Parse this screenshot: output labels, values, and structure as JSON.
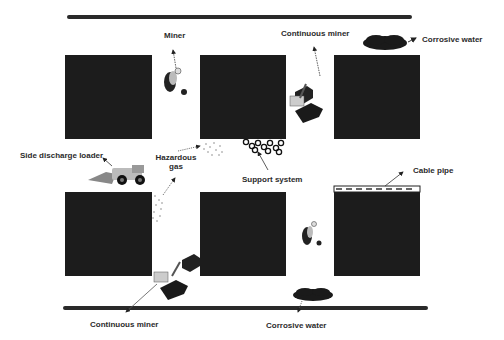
{
  "diagram": {
    "walls": [
      {
        "id": "top-wall",
        "x": 67,
        "y": 15,
        "w": 345
      },
      {
        "id": "bottom-wall",
        "x": 63,
        "y": 306,
        "w": 365
      }
    ],
    "pillars": [
      {
        "id": "pillar-top-left",
        "x": 65,
        "y": 55,
        "w": 87,
        "h": 84
      },
      {
        "id": "pillar-top-mid",
        "x": 200,
        "y": 55,
        "w": 86,
        "h": 84
      },
      {
        "id": "pillar-top-right",
        "x": 334,
        "y": 55,
        "w": 86,
        "h": 84
      },
      {
        "id": "pillar-bot-left",
        "x": 65,
        "y": 192,
        "w": 87,
        "h": 84
      },
      {
        "id": "pillar-bot-mid",
        "x": 200,
        "y": 192,
        "w": 86,
        "h": 84
      },
      {
        "id": "pillar-bot-right",
        "x": 334,
        "y": 192,
        "w": 86,
        "h": 84
      }
    ],
    "labels": {
      "miner": "Miner",
      "continuous_miner_top": "Continuous miner",
      "corrosive_water_top": "Corrosive water",
      "side_discharge_loader": "Side discharge loader",
      "hazardous_gas_line1": "Hazardous",
      "hazardous_gas_line2": "gas",
      "support_system": "Support system",
      "cable_pipe": "Cable pipe",
      "continuous_miner_bottom": "Continuous miner",
      "corrosive_water_bottom": "Corrosive water"
    },
    "colors": {
      "pillar": "#1c1c1c",
      "wall": "#2a2a2a",
      "label": "#2b2b2b",
      "background": "#ffffff"
    }
  }
}
